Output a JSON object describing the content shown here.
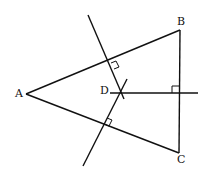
{
  "diagram": {
    "points": {
      "A": {
        "label": "A",
        "x": 26,
        "y": 94
      },
      "B": {
        "label": "B",
        "x": 180,
        "y": 30
      },
      "C": {
        "label": "C",
        "x": 179,
        "y": 153
      },
      "D": {
        "label": "D",
        "x": 120,
        "y": 93
      }
    },
    "segments": [
      "AB",
      "BC",
      "CA"
    ],
    "perpendicular_bisectors": [
      "of AB",
      "of AC",
      "of BC"
    ],
    "right_angle_marks": 3,
    "colors": {
      "stroke": "#111111",
      "background": "#ffffff"
    }
  }
}
